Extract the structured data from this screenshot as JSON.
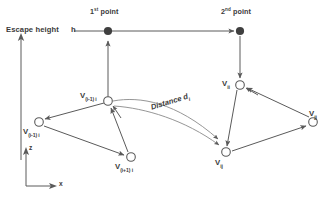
{
  "figure": {
    "background_color": "#ffffff",
    "stroke_color": "#5a5a5a",
    "text_color": "#3a3a3a",
    "filled_node_color": "#3f3f3f",
    "open_node_fill": "#ffffff"
  },
  "annotations": {
    "escape_height_label": "Escape height",
    "escape_height_symbol": "h",
    "first_point_label": "1st point",
    "first_point_sup": "st",
    "first_point_word": " point",
    "second_point_label": "2nd point",
    "second_point_sup": "nd",
    "second_point_word": " point",
    "distance_label": "Distance d",
    "distance_sub": "i"
  },
  "axes": {
    "vertical_label": "z",
    "horizontal_label": "x"
  },
  "nodes": [
    {
      "id": "p1",
      "name": "first-point",
      "type": "filled",
      "x": 108,
      "y": 32,
      "label": "",
      "sub": ""
    },
    {
      "id": "p2",
      "name": "second-point",
      "type": "filled",
      "x": 240,
      "y": 32,
      "label": "",
      "sub": ""
    },
    {
      "id": "vi",
      "name": "node-v-i",
      "type": "open",
      "x": 108,
      "y": 101,
      "label": "V",
      "sub": "(i-1)   i"
    },
    {
      "id": "vim1",
      "name": "node-v-i-minus-1",
      "type": "open",
      "x": 39,
      "y": 122,
      "label": "V",
      "sub": "(i-1)   i"
    },
    {
      "id": "vip1",
      "name": "node-v-i-plus-1",
      "type": "open",
      "x": 131,
      "y": 157,
      "label": "V",
      "sub": "(i+1)   i"
    },
    {
      "id": "vii",
      "name": "node-v-ii",
      "type": "open",
      "x": 240,
      "y": 85,
      "label": "V",
      "sub": "ii"
    },
    {
      "id": "vij",
      "name": "node-v-ij",
      "type": "open",
      "x": 226,
      "y": 152,
      "label": "V",
      "sub": "ij"
    },
    {
      "id": "vjj",
      "name": "node-v-jj",
      "type": "open",
      "x": 313,
      "y": 122,
      "label": "V",
      "sub": "jj"
    }
  ],
  "edges": [
    {
      "name": "edge-escape-to-p1",
      "from": "escape-axis",
      "to": "p1",
      "arrow": "none"
    },
    {
      "name": "edge-p1-to-p2",
      "from": "p1",
      "to": "p2",
      "arrow": "end"
    },
    {
      "name": "edge-vi-to-p1",
      "from": "vi",
      "to": "p1",
      "arrow": "end"
    },
    {
      "name": "edge-p2-to-vii",
      "from": "p2",
      "to": "vii",
      "arrow": "end"
    },
    {
      "name": "edge-vi-to-vim1",
      "from": "vi",
      "to": "vim1",
      "arrow": "end"
    },
    {
      "name": "edge-vim1-to-vip1",
      "from": "vim1",
      "to": "vip1",
      "arrow": "end"
    },
    {
      "name": "edge-vip1-to-vi",
      "from": "vip1",
      "to": "vi",
      "arrow": "end"
    },
    {
      "name": "edge-vii-to-vij",
      "from": "vii",
      "to": "vij",
      "arrow": "end"
    },
    {
      "name": "edge-vij-to-vjj",
      "from": "vij",
      "to": "vjj",
      "arrow": "end"
    },
    {
      "name": "edge-vjj-to-vii",
      "from": "vjj",
      "to": "vii",
      "arrow": "end"
    },
    {
      "name": "edge-distance-brace-upper",
      "from": "vi",
      "to": "vij",
      "arrow": "end"
    },
    {
      "name": "edge-distance-brace-lower",
      "from": "vi",
      "to": "vij",
      "arrow": "end"
    }
  ]
}
